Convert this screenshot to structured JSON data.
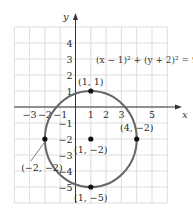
{
  "chart_data": {
    "type": "scatter",
    "title": "",
    "equation": "(x − 1)² + (y + 2)² = 9",
    "xlabel": "x",
    "ylabel": "y",
    "xlim": [
      -4,
      6
    ],
    "ylim": [
      -6,
      5
    ],
    "grid": true,
    "x_ticks": [
      -3,
      -2,
      -1,
      1,
      2,
      3,
      5
    ],
    "y_ticks": [
      4,
      3,
      2,
      1,
      -1,
      -2,
      -3,
      -4,
      -5
    ],
    "circle": {
      "center": [
        1,
        -2
      ],
      "radius": 3
    },
    "points": [
      {
        "x": 1,
        "y": 1,
        "label": "(1, 1)"
      },
      {
        "x": 1,
        "y": -2,
        "label": "(1, −2)"
      },
      {
        "x": 4,
        "y": -2,
        "label": "(4, −2)"
      },
      {
        "x": -2,
        "y": -2,
        "label": "(−2, −2)"
      },
      {
        "x": 1,
        "y": -5,
        "label": "(1, −5)"
      }
    ]
  },
  "labels": {
    "x_axis": "x",
    "y_axis": "y",
    "equation": "(x − 1)² + (y + 2)² = 9"
  },
  "colors": {
    "grid": "#d4d4d4",
    "axis": "#333333",
    "circle": "#666666",
    "point": "#111111"
  }
}
